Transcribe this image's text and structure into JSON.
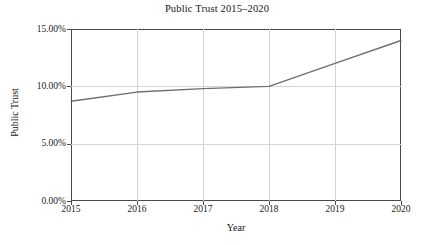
{
  "chart_data": {
    "type": "line",
    "title": "Public Trust 2015–2020",
    "xlabel": "Year",
    "ylabel": "Public Trust",
    "grid": true,
    "legend": false,
    "x": [
      2015,
      2016,
      2017,
      2018,
      2019,
      2020
    ],
    "categories": [
      "2015",
      "2016",
      "2017",
      "2018",
      "2019",
      "2020"
    ],
    "values": [
      8.7,
      9.5,
      9.8,
      10.0,
      12.0,
      14.0
    ],
    "series": [
      {
        "name": "Public Trust",
        "values": [
          8.7,
          9.5,
          9.8,
          10.0,
          12.0,
          14.0
        ]
      }
    ],
    "xlim": [
      2015,
      2020
    ],
    "ylim": [
      0,
      15
    ],
    "xticks": [
      "2015",
      "2016",
      "2017",
      "2018",
      "2019",
      "2020"
    ],
    "yticks": [
      "0.00%",
      "5.00%",
      "10.00%",
      "15.00%"
    ],
    "ytick_values": [
      0,
      5,
      10,
      15
    ],
    "y_tick_format": "percent_2dp",
    "line_color": "#6b6f75",
    "grid_color": "#d4d4d4",
    "axis_color": "#4a4a4a",
    "background": "#ffffff"
  },
  "figure": {
    "title": "Public Trust 2015–2020",
    "axis_titles": {
      "x": "Year",
      "y": "Public Trust"
    },
    "y_tick_labels": [
      "15.00%",
      "10.00%",
      "5.00%",
      "0.00%"
    ],
    "x_tick_labels": [
      "2015",
      "2016",
      "2017",
      "2018",
      "2019",
      "2020"
    ]
  }
}
